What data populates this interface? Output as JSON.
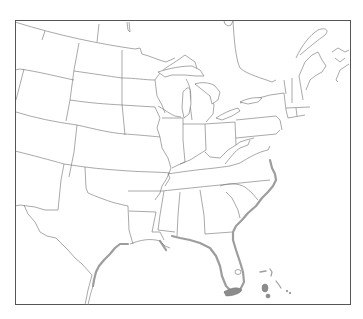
{
  "map": {
    "type": "outline-map",
    "region": "Eastern and Central United States",
    "frame": {
      "x": 15,
      "y": 20,
      "width": 336,
      "height": 285
    },
    "colors": {
      "background": "#ffffff",
      "state_border": "#6f6f6f",
      "frame_border": "#555555",
      "coastal_shading": "#8c8c8c"
    },
    "features": [
      {
        "name": "state-boundaries",
        "style": "thin gray outline"
      },
      {
        "name": "great-lakes",
        "style": "outlined water"
      },
      {
        "name": "gulf-coast-shading",
        "style": "gray band along Texas, Louisiana, Gulf Coast"
      },
      {
        "name": "atlantic-coast-shading",
        "style": "gray band along Carolinas, Georgia, Florida"
      },
      {
        "name": "florida-keys-shading",
        "style": "gray filled southern tip"
      },
      {
        "name": "bahamas-islands",
        "style": "small gray marks"
      }
    ],
    "labels": []
  }
}
